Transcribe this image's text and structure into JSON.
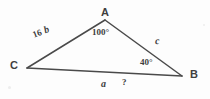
{
  "figure": {
    "type": "triangle-geometry-diagram",
    "line_color": "#4a4a4a",
    "text_color": "#3f3f3f",
    "background_color": "#fdfdfd"
  },
  "vertices": {
    "a": {
      "label": "A",
      "x": 105,
      "y": 20
    },
    "b": {
      "label": "B",
      "x": 182,
      "y": 76
    },
    "c": {
      "label": "C",
      "x": 27,
      "y": 68
    }
  },
  "angles": {
    "at_a": "100°",
    "at_b": "40°"
  },
  "sides": {
    "b_name": "b",
    "b_measure": "16",
    "c_name": "c",
    "a_name": "a",
    "a_measure": "?"
  }
}
